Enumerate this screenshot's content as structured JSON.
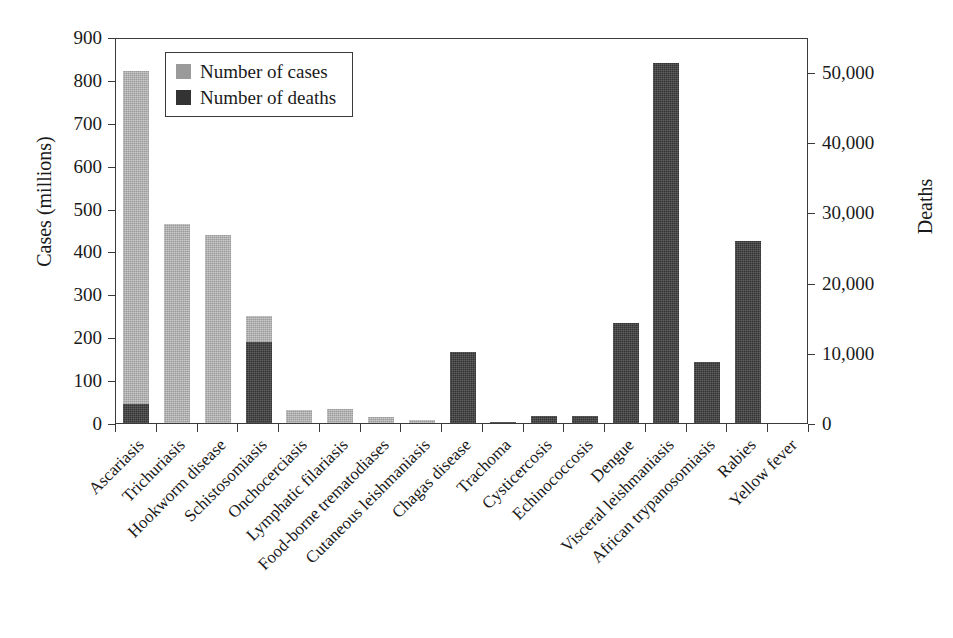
{
  "chart_data": {
    "type": "bar",
    "title": "",
    "subtitle": "",
    "xlabel": "",
    "ylabel": "Cases (millions)",
    "y2label": "Deaths",
    "ylim": [
      0,
      900
    ],
    "y2lim": [
      0,
      55000
    ],
    "grid": false,
    "legend_position": "top-left",
    "bar_style": "overlaid",
    "yticks": [
      "0",
      "100",
      "200",
      "300",
      "400",
      "500",
      "600",
      "700",
      "800",
      "900"
    ],
    "ytick_values": [
      0,
      100,
      200,
      300,
      400,
      500,
      600,
      700,
      800,
      900
    ],
    "y2ticks": [
      "0",
      "10,000",
      "20,000",
      "30,000",
      "40,000",
      "50,000"
    ],
    "y2tick_values": [
      0,
      10000,
      20000,
      30000,
      40000,
      50000
    ],
    "categories": [
      "Ascariasis",
      "Trichuriasis",
      "Hookworm disease",
      "Schistosomiasis",
      "Onchocerciasis",
      "Lymphatic filariasis",
      "Food-borne trematodiases",
      "Cutaneous leishmaniasis",
      "Chagas disease",
      "Trachoma",
      "Cysticercosis",
      "Echinococcosis",
      "Dengue",
      "Visceral leishmaniasis",
      "African trypanosomiasis",
      "Rabies",
      "Yellow fever"
    ],
    "series": [
      {
        "name": "Number of cases",
        "axis": "left",
        "unit": "millions",
        "color": "#9a9a9a",
        "values": [
          820,
          465,
          438,
          249,
          30,
          33,
          15,
          8,
          0,
          2,
          0,
          0,
          0,
          0,
          0,
          0,
          0
        ]
      },
      {
        "name": "Number of deaths",
        "axis": "right",
        "unit": "deaths",
        "color": "#333333",
        "values": [
          2750,
          0,
          0,
          11600,
          0,
          0,
          0,
          0,
          10100,
          150,
          1050,
          980,
          14300,
          51500,
          8700,
          26000,
          0
        ]
      }
    ],
    "deaths_in_left_scale_units": [
      45,
      0,
      0,
      190,
      0,
      0,
      0,
      0,
      165,
      2,
      17,
      16,
      234,
      840,
      142,
      425,
      0
    ]
  },
  "legend": {
    "items": [
      {
        "label": "Number of cases",
        "swatch": "cases-swatch",
        "color": "#9a9a9a"
      },
      {
        "label": "Number of deaths",
        "swatch": "deaths-swatch",
        "color": "#333333"
      }
    ]
  },
  "axes": {
    "left_title": "Cases (millions)",
    "right_title": "Deaths"
  }
}
